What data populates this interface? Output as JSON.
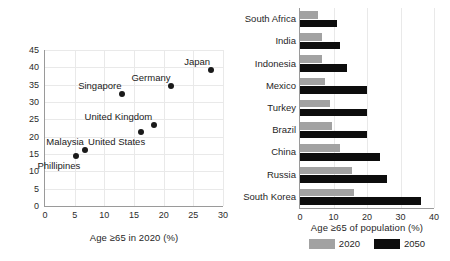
{
  "chart_data": [
    {
      "type": "scatter",
      "title": "",
      "xlabel": "Age ≥65 in 2020 (%)",
      "ylabel": "Age ≥65 in 2050 (%)",
      "xlim": [
        0,
        30
      ],
      "ylim": [
        0,
        45
      ],
      "xticks": [
        "0",
        "5",
        "10",
        "15",
        "20",
        "25",
        "30"
      ],
      "yticks": [
        "0",
        "5",
        "10",
        "15",
        "20",
        "25",
        "30",
        "35",
        "40",
        "45"
      ],
      "grid": true,
      "legend": "none",
      "points": [
        {
          "label": "Phillipines",
          "x": 5.3,
          "y": 14.3,
          "label_pos": "below-left"
        },
        {
          "label": "Malaysia",
          "x": 6.8,
          "y": 16.2,
          "label_pos": "above-left"
        },
        {
          "label": "Singapore",
          "x": 13.0,
          "y": 32.2,
          "label_pos": "above-left"
        },
        {
          "label": "United States",
          "x": 16.2,
          "y": 21.3,
          "label_pos": "below-left"
        },
        {
          "label": "United Kingdom",
          "x": 18.3,
          "y": 23.5,
          "label_pos": "above-left"
        },
        {
          "label": "Germany",
          "x": 21.3,
          "y": 34.5,
          "label_pos": "above-left"
        },
        {
          "label": "Japan",
          "x": 28.0,
          "y": 39.3,
          "label_pos": "above-left"
        }
      ]
    },
    {
      "type": "bar",
      "orientation": "horizontal",
      "title": "",
      "xlabel": "Age ≥65 of population (%)",
      "ylabel": "",
      "xlim": [
        0,
        40
      ],
      "xticks": [
        "0",
        "10",
        "20",
        "30",
        "40"
      ],
      "grid": true,
      "legend_position": "bottom",
      "categories": [
        "South Africa",
        "India",
        "Indonesia",
        "Mexico",
        "Turkey",
        "Brazil",
        "China",
        "Russia",
        "South Korea"
      ],
      "series": [
        {
          "name": "2020",
          "color": "#a2a2a2",
          "values": [
            5.5,
            6.5,
            6.5,
            7.5,
            9.0,
            9.5,
            12.0,
            15.5,
            16.0
          ]
        },
        {
          "name": "2050",
          "color": "#0d0d0d",
          "values": [
            11.0,
            12.0,
            14.0,
            20.0,
            20.0,
            20.0,
            24.0,
            26.0,
            36.0
          ]
        }
      ]
    }
  ],
  "scatter": {
    "xlabel": "Age ≥65 in 2020 (%)",
    "ylabel": "Age ≥65 in 2050 (%)"
  },
  "bars": {
    "xlabel": "Age ≥65 of population (%)",
    "legend": [
      {
        "label": "2020"
      },
      {
        "label": "2050"
      }
    ]
  }
}
